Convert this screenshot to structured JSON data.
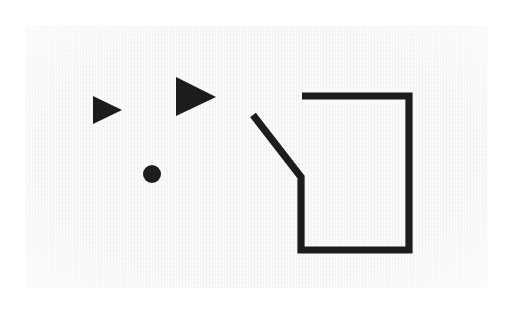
{
  "figure": {
    "caption": "Two solid right-pointing triangles, a solid filled dot, and an open polygon outline with a diagonal tail.",
    "background_color": "#fafafa",
    "page_color": "#ffffff",
    "ink_color": "#1c1c1c",
    "canvas": {
      "width": 512,
      "height": 310
    },
    "paper_area": {
      "x": 26,
      "y": 26,
      "width": 462,
      "height": 262
    },
    "stroke_width": 7.2,
    "shapes": [
      {
        "name": "small-triangle",
        "type": "triangle",
        "label": "Small right-pointing triangle",
        "fill": "solid",
        "points": "93,96 93,124 122,110",
        "bbox": {
          "x": 93,
          "y": 96,
          "width": 29,
          "height": 28
        }
      },
      {
        "name": "large-triangle",
        "type": "triangle",
        "label": "Large right-pointing triangle",
        "fill": "solid",
        "points": "176,77 176,116 216,97",
        "bbox": {
          "x": 176,
          "y": 77,
          "width": 40,
          "height": 39
        }
      },
      {
        "name": "dot",
        "type": "circle",
        "label": "Solid round dot",
        "fill": "solid",
        "center": {
          "cx": 152,
          "cy": 174
        },
        "radius": 9
      },
      {
        "name": "notched-polygon",
        "type": "polyline",
        "label": "Open polygon outline with diagonal tail",
        "fill": "none",
        "points": "253,115 301,177 301,250 409,250 409,96 302,96"
      }
    ]
  }
}
